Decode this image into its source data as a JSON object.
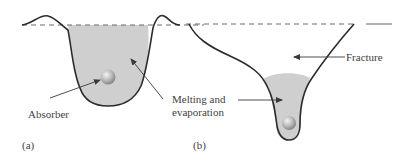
{
  "panels": [
    {
      "id": "a",
      "label": "(a)",
      "callouts": {
        "absorber": "Absorber"
      }
    },
    {
      "id": "b",
      "label": "(b)",
      "callouts": {
        "fracture": "Fracture"
      }
    }
  ],
  "shared_callouts": {
    "melting_line1": "Melting and",
    "melting_line2": "evaporation"
  },
  "colors": {
    "outline": "#2b2b2b",
    "fill": "#cfcfcf",
    "surface_dash": "#6a6a6a",
    "arrow": "#3a3a3a",
    "ball_light": "#f2f2f2",
    "ball_dark": "#8a8a8a"
  }
}
